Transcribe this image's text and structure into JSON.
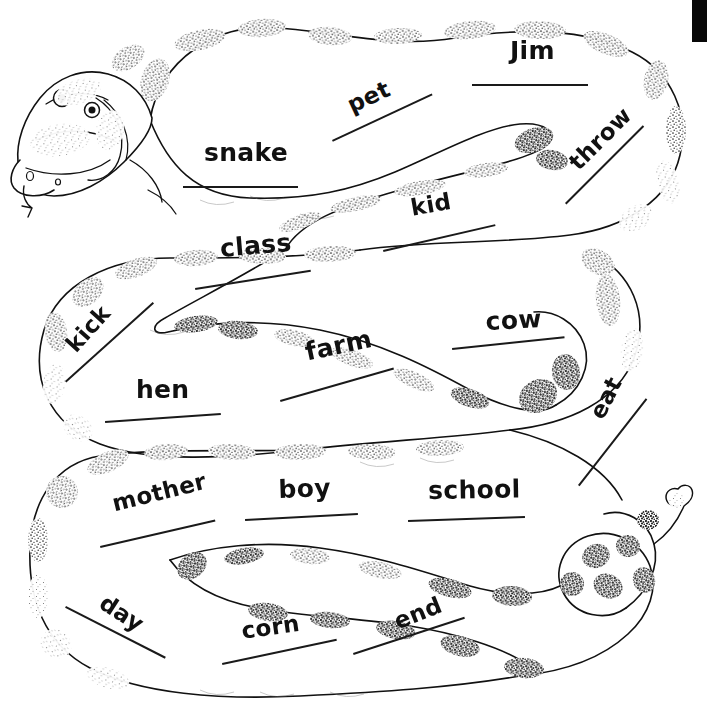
{
  "page": {
    "width": 707,
    "height": 726,
    "background_color": "#ffffff",
    "ink_color": "#111111",
    "artwork_name": "rattlesnake-line-drawing",
    "artwork_description": "Stippled black-and-white line drawing of a coiled rattlesnake winding back and forth across the page, head at upper left with forked tongue, rattle at lower right"
  },
  "scan_artifact": {
    "name": "black-edge-bar",
    "color": "#080808",
    "x": 692,
    "y": 0,
    "width": 15,
    "height": 42
  },
  "words": [
    {
      "id": "snake",
      "label": "snake",
      "x": 204,
      "y": 140,
      "rotate": 0,
      "line_x": 183,
      "line_y": 186,
      "line_w": 115,
      "line_rotate": 0,
      "size": "w-lg"
    },
    {
      "id": "pet",
      "label": "pet",
      "x": 344,
      "y": 96,
      "rotate": -25,
      "line_x": 332,
      "line_y": 140,
      "line_w": 110,
      "line_rotate": -25,
      "size": "w-md"
    },
    {
      "id": "jim",
      "label": "Jim",
      "x": 510,
      "y": 38,
      "rotate": 0,
      "line_x": 472,
      "line_y": 84,
      "line_w": 116,
      "line_rotate": 0,
      "size": "w-lg"
    },
    {
      "id": "throw",
      "label": "throw",
      "x": 565,
      "y": 158,
      "rotate": -45,
      "line_x": 565,
      "line_y": 203,
      "line_w": 110,
      "line_rotate": -45,
      "size": "w-md"
    },
    {
      "id": "kid",
      "label": "kid",
      "x": 409,
      "y": 197,
      "rotate": -10,
      "line_x": 383,
      "line_y": 250,
      "line_w": 115,
      "line_rotate": -13,
      "size": "w-md"
    },
    {
      "id": "class",
      "label": "class",
      "x": 219,
      "y": 236,
      "rotate": -5,
      "line_x": 195,
      "line_y": 288,
      "line_w": 117,
      "line_rotate": -9,
      "size": "w-lg"
    },
    {
      "id": "kick",
      "label": "kick",
      "x": 62,
      "y": 341,
      "rotate": -48,
      "line_x": 65,
      "line_y": 381,
      "line_w": 118,
      "line_rotate": -42,
      "size": "w-md"
    },
    {
      "id": "farm",
      "label": "farm",
      "x": 303,
      "y": 340,
      "rotate": -12,
      "line_x": 280,
      "line_y": 400,
      "line_w": 118,
      "line_rotate": -16,
      "size": "w-lg"
    },
    {
      "id": "cow",
      "label": "cow",
      "x": 485,
      "y": 309,
      "rotate": -3,
      "line_x": 452,
      "line_y": 348,
      "line_w": 113,
      "line_rotate": -6,
      "size": "w-lg"
    },
    {
      "id": "hen",
      "label": "hen",
      "x": 136,
      "y": 377,
      "rotate": 0,
      "line_x": 105,
      "line_y": 421,
      "line_w": 116,
      "line_rotate": -4,
      "size": "w-lg"
    },
    {
      "id": "eat",
      "label": "eat",
      "x": 586,
      "y": 412,
      "rotate": -63,
      "line_x": 578,
      "line_y": 485,
      "line_w": 110,
      "line_rotate": -52,
      "size": "w-md"
    },
    {
      "id": "mother",
      "label": "mother",
      "x": 110,
      "y": 493,
      "rotate": -14,
      "line_x": 100,
      "line_y": 546,
      "line_w": 118,
      "line_rotate": -13,
      "size": "w-md"
    },
    {
      "id": "boy",
      "label": "boy",
      "x": 278,
      "y": 477,
      "rotate": -2,
      "line_x": 245,
      "line_y": 519,
      "line_w": 113,
      "line_rotate": -3,
      "size": "w-lg"
    },
    {
      "id": "school",
      "label": "school",
      "x": 428,
      "y": 478,
      "rotate": -1,
      "line_x": 408,
      "line_y": 520,
      "line_w": 117,
      "line_rotate": -2,
      "size": "w-lg"
    },
    {
      "id": "day",
      "label": "day",
      "x": 108,
      "y": 591,
      "rotate": 33,
      "line_x": 66,
      "line_y": 606,
      "line_w": 112,
      "line_rotate": 27,
      "size": "w-md"
    },
    {
      "id": "corn",
      "label": "corn",
      "x": 240,
      "y": 620,
      "rotate": -8,
      "line_x": 222,
      "line_y": 663,
      "line_w": 117,
      "line_rotate": -12,
      "size": "w-md"
    },
    {
      "id": "end",
      "label": "end",
      "x": 391,
      "y": 612,
      "rotate": -22,
      "line_x": 353,
      "line_y": 653,
      "line_w": 117,
      "line_rotate": -18,
      "size": "w-md"
    }
  ]
}
